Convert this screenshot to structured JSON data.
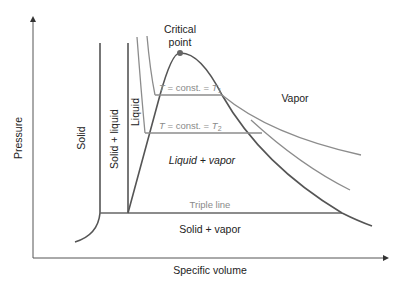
{
  "diagram": {
    "type": "pressure-specific volume phase diagram",
    "axes": {
      "x_label": "Specific volume",
      "y_label": "Pressure"
    },
    "regions": {
      "solid": "Solid",
      "solid_liquid": "Solid + liquid",
      "liquid": "Liquid",
      "liquid_vapor": "Liquid + vapor",
      "vapor": "Vapor",
      "solid_vapor": "Solid + vapor"
    },
    "annotations": {
      "critical_point_line1": "Critical",
      "critical_point_line2": "point",
      "triple_line": "Triple line",
      "isotherm1": "T = const. = T",
      "isotherm1_sub": "1",
      "isotherm2": "T = const. = T",
      "isotherm2_sub": "2"
    },
    "colors": {
      "dark_line": "#555555",
      "gray_line": "#8c8c8c",
      "point": "#666666"
    }
  }
}
